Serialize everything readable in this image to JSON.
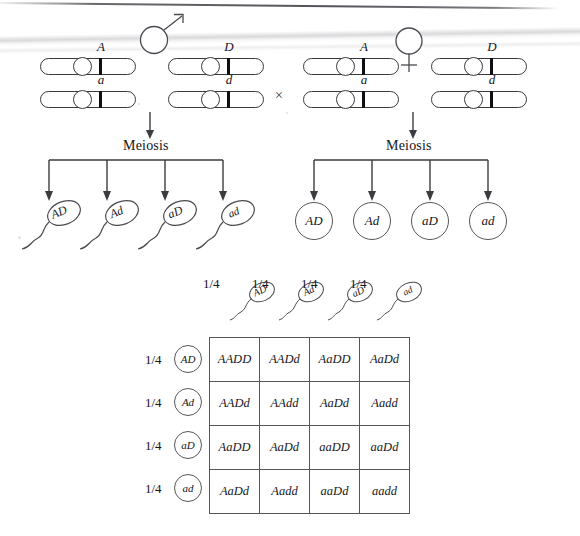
{
  "figure": {
    "type": "dihybrid-cross-punnett-square",
    "cross_symbol": "×",
    "male_symbol": "male-sex-symbol",
    "female_symbol": "female-sex-symbol"
  },
  "parents": {
    "male": {
      "label": "male",
      "chromosome_pairs": [
        {
          "top_allele": "A",
          "bottom_allele": "a"
        },
        {
          "top_allele": "D",
          "bottom_allele": "d"
        }
      ]
    },
    "female": {
      "label": "female",
      "chromosome_pairs": [
        {
          "top_allele": "A",
          "bottom_allele": "a"
        },
        {
          "top_allele": "D",
          "bottom_allele": "d"
        }
      ]
    }
  },
  "meiosis": {
    "male_label": "Meiosis",
    "female_label": "Meiosis"
  },
  "gametes": {
    "sperm": [
      "AD",
      "Ad",
      "aD",
      "ad"
    ],
    "eggs": [
      "AD",
      "Ad",
      "aD",
      "ad"
    ]
  },
  "punnett": {
    "column_fraction": "1/4",
    "row_fraction": "1/4",
    "column_headers": [
      "AD",
      "Ad",
      "aD",
      "ad"
    ],
    "row_headers": [
      "AD",
      "Ad",
      "aD",
      "ad"
    ],
    "cells": [
      [
        "AADD",
        "AADd",
        "AaDD",
        "AaDd"
      ],
      [
        "AADd",
        "AAdd",
        "AaDd",
        "Aadd"
      ],
      [
        "AaDD",
        "AaDd",
        "aaDD",
        "aaDd"
      ],
      [
        "AaDd",
        "Aadd",
        "aaDd",
        "aadd"
      ]
    ]
  },
  "colors": {
    "ink": "#15151a",
    "line": "#3b3b40",
    "grid": "#55555a",
    "locus": "#101014",
    "paper": "#ffffff"
  }
}
